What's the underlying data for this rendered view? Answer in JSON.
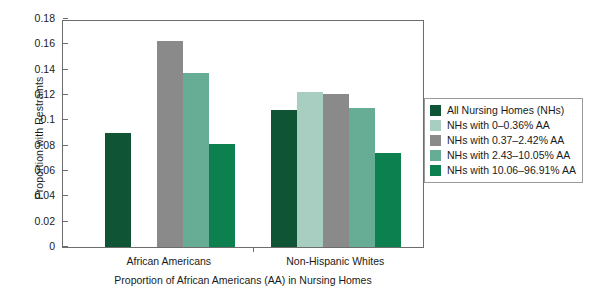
{
  "chart_data": {
    "type": "bar",
    "title": "",
    "xlabel": "Proportion of African Americans (AA) in Nursing Homes",
    "ylabel": "Proportion with Restraints",
    "categories": [
      "African Americans",
      "Non-Hispanic Whites"
    ],
    "ylim": [
      0,
      0.18
    ],
    "ytick_labels": [
      "0",
      "0.02",
      "0.04",
      "0.06",
      "0.08",
      "0.1",
      "0.12",
      "0.14",
      "0.16",
      "0.18"
    ],
    "ytick_values": [
      0,
      0.02,
      0.04,
      0.06,
      0.08,
      0.1,
      0.12,
      0.14,
      0.16,
      0.18
    ],
    "grid": false,
    "legend_position": "right",
    "series": [
      {
        "name": "All Nursing Homes (NHs)",
        "color": "#0f5434",
        "values": [
          0.09,
          0.108
        ]
      },
      {
        "name": "NHs with 0–0.36% AA",
        "color": "#a8cec1",
        "values": [
          0.0,
          0.122
        ]
      },
      {
        "name": "NHs with 0.37–2.42% AA",
        "color": "#8a8a8a",
        "values": [
          0.163,
          0.121
        ]
      },
      {
        "name": "NHs with 2.43–10.05% AA",
        "color": "#67ad96",
        "values": [
          0.137,
          0.11
        ]
      },
      {
        "name": "NHs with 10.06–96.91% AA",
        "color": "#0d8050",
        "values": [
          0.081,
          0.074
        ]
      }
    ]
  },
  "axes": {
    "y_title": "Proportion with Restraints",
    "x_title": "Proportion of African Americans (AA) in Nursing Homes",
    "group_labels": [
      "African Americans",
      "Non-Hispanic Whites"
    ],
    "y_labels": [
      "0.18",
      "0.16",
      "0.14",
      "0.12",
      "0.1",
      "0.08",
      "0.06",
      "0.04",
      "0.02",
      "0"
    ]
  },
  "legend": {
    "items": [
      {
        "label": "All Nursing Homes (NHs)",
        "color": "#0f5434"
      },
      {
        "label": "NHs with 0–0.36% AA",
        "color": "#a8cec1"
      },
      {
        "label": "NHs with 0.37–2.42% AA",
        "color": "#8a8a8a"
      },
      {
        "label": "NHs with 2.43–10.05% AA",
        "color": "#67ad96"
      },
      {
        "label": "NHs with 10.06–96.91% AA",
        "color": "#0d8050"
      }
    ]
  }
}
